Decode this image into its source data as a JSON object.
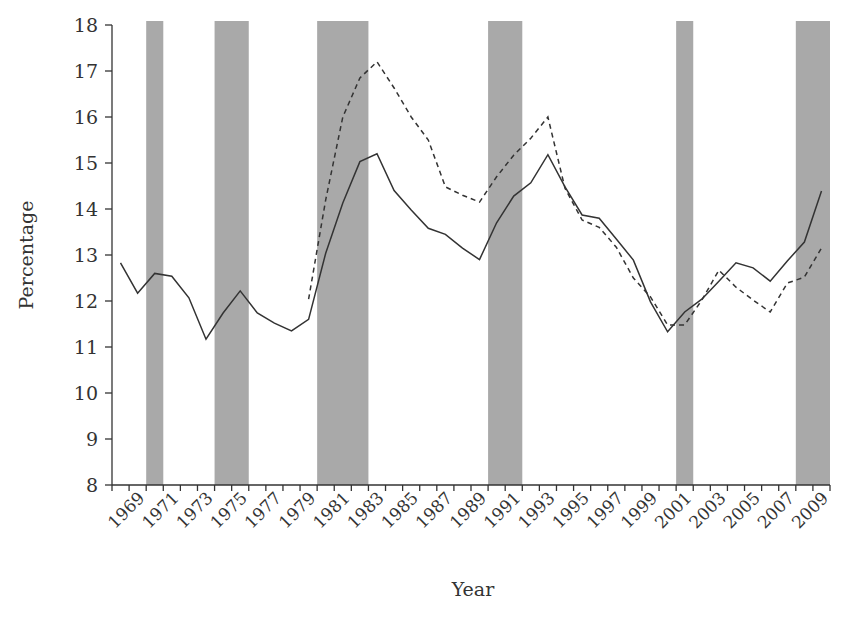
{
  "chart_data": {
    "type": "line",
    "title": "",
    "xlabel": "Year",
    "ylabel": "Percentage",
    "ylim": [
      8,
      18
    ],
    "yticks": [
      8,
      9,
      10,
      11,
      12,
      13,
      14,
      15,
      16,
      17,
      18
    ],
    "xtick_labels": [
      "1969",
      "1971",
      "1973",
      "1975",
      "1977",
      "1979",
      "1981",
      "1983",
      "1985",
      "1987",
      "1989",
      "1991",
      "1993",
      "1995",
      "1997",
      "1999",
      "2001",
      "2003",
      "2005",
      "2007",
      "2009"
    ],
    "x": [
      1968,
      1969,
      1970,
      1971,
      1972,
      1973,
      1974,
      1975,
      1976,
      1977,
      1978,
      1979,
      1980,
      1981,
      1982,
      1983,
      1984,
      1985,
      1986,
      1987,
      1988,
      1989,
      1990,
      1991,
      1992,
      1993,
      1994,
      1995,
      1996,
      1997,
      1998,
      1999,
      2000,
      2001,
      2002,
      2003,
      2004,
      2005,
      2006,
      2007,
      2008,
      2009
    ],
    "grid": false,
    "legend": null,
    "series": [
      {
        "name": "Solid line",
        "style": "solid",
        "values": [
          12.83,
          12.17,
          12.6,
          12.54,
          12.07,
          11.17,
          11.74,
          12.22,
          11.74,
          11.52,
          11.35,
          11.6,
          13.04,
          14.13,
          15.03,
          15.2,
          14.4,
          13.98,
          13.58,
          13.45,
          13.15,
          12.9,
          13.7,
          14.28,
          14.57,
          15.18,
          14.48,
          13.87,
          13.8,
          13.35,
          12.89,
          11.98,
          11.33,
          11.76,
          12.04,
          12.43,
          12.83,
          12.72,
          12.43,
          12.87,
          13.28,
          14.39
        ]
      },
      {
        "name": "Dashed line",
        "style": "dashed",
        "values": [
          null,
          null,
          null,
          null,
          null,
          null,
          null,
          null,
          null,
          null,
          null,
          12.04,
          14.2,
          16.0,
          16.85,
          17.2,
          16.63,
          16.0,
          15.5,
          14.48,
          14.3,
          14.15,
          14.7,
          15.17,
          15.54,
          16.0,
          14.45,
          13.76,
          13.6,
          13.17,
          12.5,
          12.09,
          11.48,
          11.48,
          12.02,
          12.67,
          12.3,
          12.02,
          11.76,
          12.39,
          12.52,
          13.15
        ]
      }
    ],
    "shaded_regions": [
      {
        "label": "recession",
        "start": 1970,
        "end": 1970
      },
      {
        "label": "recession",
        "start": 1974,
        "end": 1975
      },
      {
        "label": "recession",
        "start": 1980,
        "end": 1982
      },
      {
        "label": "recession",
        "start": 1990,
        "end": 1991
      },
      {
        "label": "recession",
        "start": 2001,
        "end": 2001
      },
      {
        "label": "recession",
        "start": 2008,
        "end": 2009
      }
    ],
    "colors": {
      "line": "#333333",
      "shade": "#a9a9a9",
      "background": "#ffffff"
    }
  }
}
